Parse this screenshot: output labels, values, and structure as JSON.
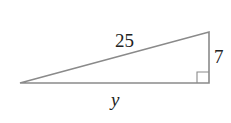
{
  "diagram": {
    "type": "right-triangle",
    "labels": {
      "hypotenuse": "25",
      "vertical_leg": "7",
      "horizontal_leg": "y"
    },
    "right_angle_marker": true,
    "colors": {
      "stroke": "#8a8a8a",
      "text": "#222222"
    }
  }
}
